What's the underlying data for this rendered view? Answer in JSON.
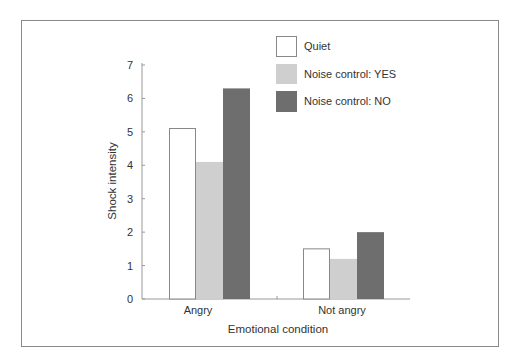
{
  "chart_data": {
    "type": "bar",
    "title": "",
    "xlabel": "Emotional condition",
    "ylabel": "Shock intensity",
    "ylim": [
      0,
      7
    ],
    "yticks": [
      0,
      1,
      2,
      3,
      4,
      5,
      6,
      7
    ],
    "categories": [
      "Angry",
      "Not angry"
    ],
    "series": [
      {
        "name": "Quiet",
        "color": "#ffffff",
        "values": [
          5.1,
          1.5
        ]
      },
      {
        "name": "Noise control: YES",
        "color": "#cfcfcf",
        "values": [
          4.1,
          1.2
        ]
      },
      {
        "name": "Noise control: NO",
        "color": "#6e6e6e",
        "values": [
          6.3,
          2.0
        ]
      }
    ],
    "legend_position": "upper right",
    "grid": false
  },
  "labels": {
    "xlabel": "Emotional condition",
    "ylabel": "Shock intensity",
    "cat0": "Angry",
    "cat1": "Not angry",
    "legend0": "Quiet",
    "legend1": "Noise control: YES",
    "legend2": "Noise control: NO"
  }
}
